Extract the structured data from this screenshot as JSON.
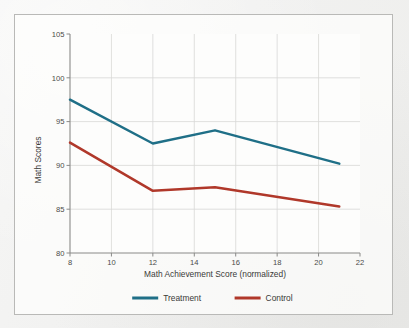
{
  "chart_data": {
    "type": "line",
    "title": "",
    "xlabel": "Math Achievement Score (normalized)",
    "ylabel": "Math Scores",
    "xlim": [
      8,
      22
    ],
    "ylim": [
      80,
      105
    ],
    "xticks": [
      8,
      10,
      12,
      14,
      16,
      18,
      20,
      22
    ],
    "xtick_labels": [
      "8",
      "10",
      "12",
      "14",
      "16",
      "18",
      "20",
      "22"
    ],
    "yticks": [
      80,
      85,
      90,
      95,
      100,
      105
    ],
    "ytick_labels": [
      "80",
      "85",
      "90",
      "95",
      "100",
      "105"
    ],
    "grid": true,
    "grid_x": [
      10,
      12,
      14,
      16,
      18,
      20
    ],
    "grid_y": [
      85,
      90,
      95,
      100
    ],
    "legend_position": "below-bottom-center",
    "x": [
      8,
      12,
      15,
      21
    ],
    "series": [
      {
        "name": "Treatment",
        "color": "#1f6f87",
        "x": [
          8,
          12,
          15,
          21
        ],
        "values": [
          97.5,
          92.5,
          94.0,
          90.2
        ]
      },
      {
        "name": "Control",
        "color": "#b0382a",
        "x": [
          8,
          12,
          15,
          21
        ],
        "values": [
          92.6,
          87.1,
          87.5,
          85.3
        ]
      }
    ]
  },
  "figure": {
    "background_color": "#f3f3f2",
    "panel_color": "#fdfdfc",
    "border_color": "#b9b9b7",
    "axis_color": "#8a8a88",
    "grid_color": "#d8d8d6",
    "text_color": "#3a3a38"
  },
  "legend": {
    "entries": [
      {
        "label": "Treatment",
        "color": "#1f6f87"
      },
      {
        "label": "Control",
        "color": "#b0382a"
      }
    ]
  }
}
